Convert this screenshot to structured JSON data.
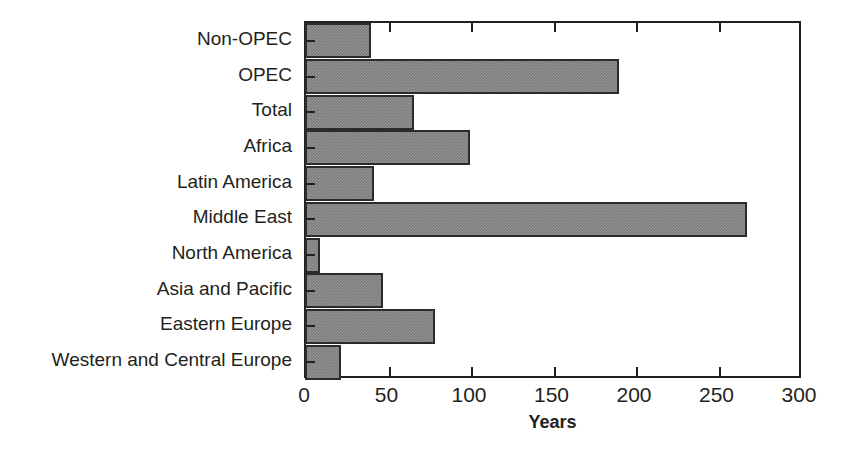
{
  "chart_data": {
    "type": "bar",
    "orientation": "horizontal",
    "title": "",
    "xlabel": "Years",
    "ylabel": "",
    "xlim": [
      0,
      300
    ],
    "xticks": [
      0,
      50,
      100,
      150,
      200,
      250,
      300
    ],
    "xtick_labels": [
      "0",
      "50",
      "100",
      "150",
      "200",
      "250",
      "300"
    ],
    "grid": false,
    "legend": null,
    "bar_color": "#7b7b7b",
    "bar_edge_color": "#2b2b2b",
    "axis_color": "#231f20",
    "background_color": "#ffffff",
    "categories": [
      "Non-OPEC",
      "OPEC",
      "Total",
      "Africa",
      "Latin America",
      "Middle East",
      "North America",
      "Asia and Pacific",
      "Eastern Europe",
      "Western and Central Europe"
    ],
    "values": [
      40,
      190,
      66,
      100,
      42,
      268,
      9,
      47,
      79,
      22
    ]
  }
}
